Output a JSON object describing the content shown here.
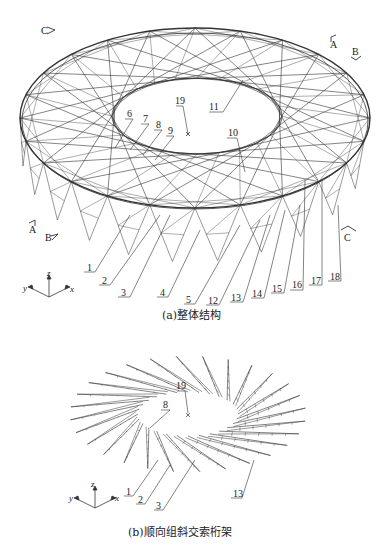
{
  "figure_a": {
    "caption": "(a)整体结构",
    "section_marks": {
      "C_top": "C",
      "A_right": "A",
      "B_right": "B",
      "A_left": "A",
      "B_left": "B",
      "C_right": "C"
    },
    "top_labels": [
      "19",
      "11",
      "6",
      "7",
      "8",
      "9",
      "10"
    ],
    "bottom_labels": [
      "1",
      "2",
      "3",
      "4",
      "5",
      "12",
      "13",
      "14",
      "15",
      "16",
      "17",
      "18"
    ],
    "axes": {
      "x": "x",
      "y": "y",
      "z": "z"
    }
  },
  "figure_b": {
    "caption": "(b)顺向组斜交索桁架",
    "labels": [
      "19",
      "8",
      "1",
      "2",
      "3",
      "13"
    ],
    "axes": {
      "x": "x",
      "y": "y",
      "z": "z"
    }
  },
  "colors": {
    "line": "#333333",
    "background": "#ffffff"
  }
}
